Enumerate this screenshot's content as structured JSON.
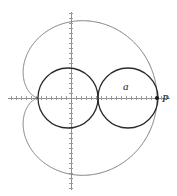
{
  "figure": {
    "background_color": "#ffffff",
    "width": 177,
    "height": 196
  },
  "axes": {
    "origin": {
      "x": 71,
      "y": 98
    },
    "x_axis": {
      "from_x": 8,
      "to_x": 170,
      "y": 98,
      "color": "#8e8e8e"
    },
    "y_axis": {
      "x": 71,
      "from_y": 12,
      "to_y": 190,
      "color": "#8e8e8e"
    },
    "tick_spacing_px": 5,
    "tick_length_px": 3,
    "tick_color": "#9a9a9a"
  },
  "curves": {
    "cardioid": {
      "name": "cardioid",
      "color": "#7a7a7a",
      "stroke_width": 1,
      "cusp": {
        "x": 38,
        "y": 98
      },
      "rightmost": {
        "x": 157,
        "y": 98
      },
      "topmost": {
        "x": 83,
        "y": 17
      },
      "bottommost": {
        "x": 83,
        "y": 179
      },
      "leftmost_x": 22
    },
    "left_circle": {
      "name": "left-circle",
      "color": "#2b2b2b",
      "stroke_width": 1.3,
      "center": {
        "x": 68,
        "y": 98
      },
      "radius": 30
    },
    "right_circle": {
      "name": "right-circle",
      "color": "#2b2b2b",
      "stroke_width": 1.3,
      "center": {
        "x": 128,
        "y": 98
      },
      "radius": 30
    }
  },
  "labels": [
    {
      "id": "label-a",
      "text": "a",
      "x": 123,
      "y": 90,
      "style": "italic"
    },
    {
      "id": "label-p",
      "text": "P",
      "x": 162,
      "y": 102,
      "style": "italic"
    }
  ],
  "points": [
    {
      "id": "point-p",
      "name": "point-P",
      "x": 157,
      "y": 98,
      "radius": 2.1,
      "color": "#1a1a1a"
    }
  ]
}
